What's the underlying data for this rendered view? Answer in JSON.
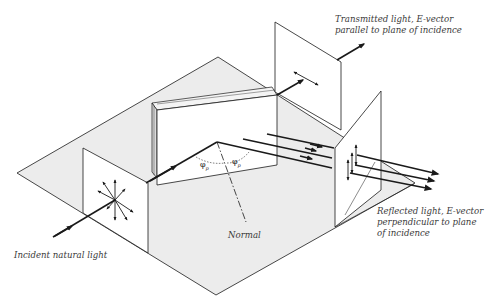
{
  "figure": {
    "labels": {
      "transmitted_line1": "Transmitted light, E-vector",
      "transmitted_line2": "parallel to plane of incidence",
      "reflected_line1": "Reflected light, E-vector",
      "reflected_line2": "perpendicular to plane",
      "reflected_line3": "of incidence",
      "incident": "Incident natural light",
      "normal": "Normal",
      "angle_symbol": "φ",
      "angle_subscript": "p"
    },
    "colors": {
      "line": "#1a1a1a",
      "floor_fill": "#ececec",
      "screen_fill": "#ffffff",
      "text": "#3a3a3a"
    }
  }
}
